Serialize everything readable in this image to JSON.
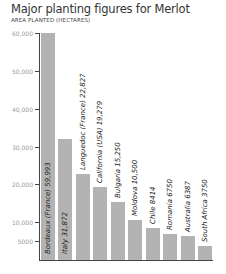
{
  "chart_data": {
    "type": "bar",
    "title": "Major planting figures for Merlot",
    "subtitle": "AREA PLANTED (HECTARES)",
    "xlabel": "",
    "ylabel": "AREA PLANTED (HECTARES)",
    "ylim": [
      0,
      60000
    ],
    "yticks": [
      5000,
      10000,
      20000,
      30000,
      40000,
      50000,
      60000
    ],
    "ytick_labels": [
      "5000",
      "10,000",
      "20,000",
      "30,000",
      "40,000",
      "50,000",
      "60,000"
    ],
    "grid": false,
    "legend": null,
    "categories": [
      "Bordeaux (France)",
      "Italy",
      "Languedoc (France)",
      "California (USA)",
      "Bulgaria",
      "Moldova",
      "Chile",
      "Romania",
      "Australia",
      "South Africa"
    ],
    "values": [
      59993,
      31872,
      22827,
      19279,
      15250,
      10500,
      8414,
      6750,
      6387,
      3750
    ],
    "bar_labels": [
      "Bordeaux (France) 59,993",
      "Italy 31,872",
      "Languedoc (France) 22,827",
      "California (USA) 19,279",
      "Bulgaria 15,250",
      "Moldova 10,500",
      "Chile 8414",
      "Romania 6750",
      "Australia 6387",
      "South Africa 3750"
    ],
    "colors": {
      "bar": "#b3b3b3",
      "axis": "#444444",
      "tick_label": "#999999"
    }
  }
}
